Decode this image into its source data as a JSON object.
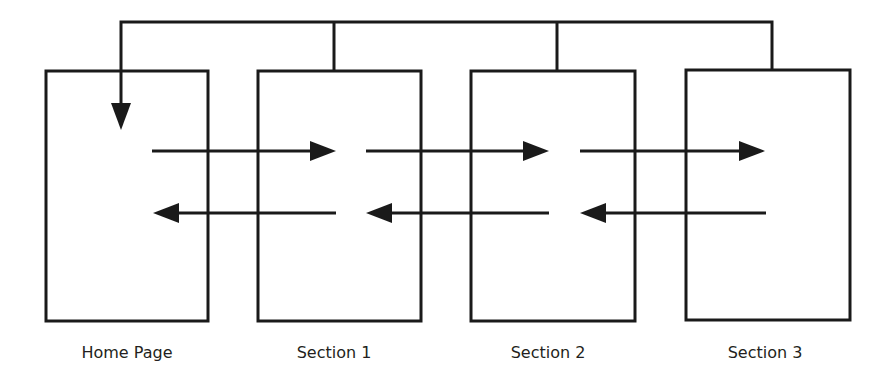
{
  "diagram": {
    "title": "",
    "colors": {
      "stroke": "#1a1a1a",
      "background": "#ffffff",
      "text": "#231f20"
    },
    "nodes": [
      {
        "id": "home",
        "label": "Home Page",
        "x": 46,
        "y": 71,
        "w": 162,
        "h": 250
      },
      {
        "id": "s1",
        "label": "Section 1",
        "x": 258,
        "y": 71,
        "w": 163,
        "h": 250
      },
      {
        "id": "s2",
        "label": "Section 2",
        "x": 471,
        "y": 71,
        "w": 164,
        "h": 250
      },
      {
        "id": "s3",
        "label": "Section 3",
        "x": 686,
        "y": 70,
        "w": 164,
        "h": 250
      }
    ],
    "edges": [
      {
        "from": "home",
        "to": "s1",
        "direction": "forward"
      },
      {
        "from": "s1",
        "to": "s2",
        "direction": "forward"
      },
      {
        "from": "s2",
        "to": "s3",
        "direction": "forward"
      },
      {
        "from": "s1",
        "to": "home",
        "direction": "back"
      },
      {
        "from": "s2",
        "to": "s1",
        "direction": "back"
      },
      {
        "from": "s3",
        "to": "s2",
        "direction": "back"
      },
      {
        "from": "s1",
        "to": "home",
        "direction": "return-to-home"
      },
      {
        "from": "s2",
        "to": "home",
        "direction": "return-to-home"
      },
      {
        "from": "s3",
        "to": "home",
        "direction": "return-to-home"
      }
    ]
  }
}
